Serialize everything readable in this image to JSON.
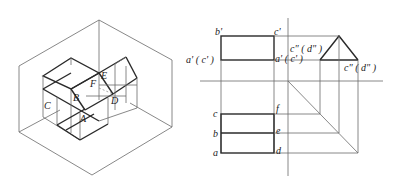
{
  "isometric": {
    "points": {
      "A": "A",
      "B": "B",
      "C": "C",
      "D": "D",
      "E": "E",
      "F": "F"
    }
  },
  "front_view": {
    "labels": {
      "b_prime": "b'",
      "c_prime": "c'",
      "a_prime_c_prime_left": "a' ( c' )",
      "a_prime_c_prime_right": "a' ( c' )"
    }
  },
  "side_view": {
    "labels": {
      "c_dd_d_dd_top": "c\" ( d\" )",
      "c_dd_d_dd_bottom": "c\" ( d\" )"
    }
  },
  "top_view": {
    "labels": {
      "a": "a",
      "b": "b",
      "c": "c",
      "d": "d",
      "e": "e",
      "f": "f"
    }
  }
}
